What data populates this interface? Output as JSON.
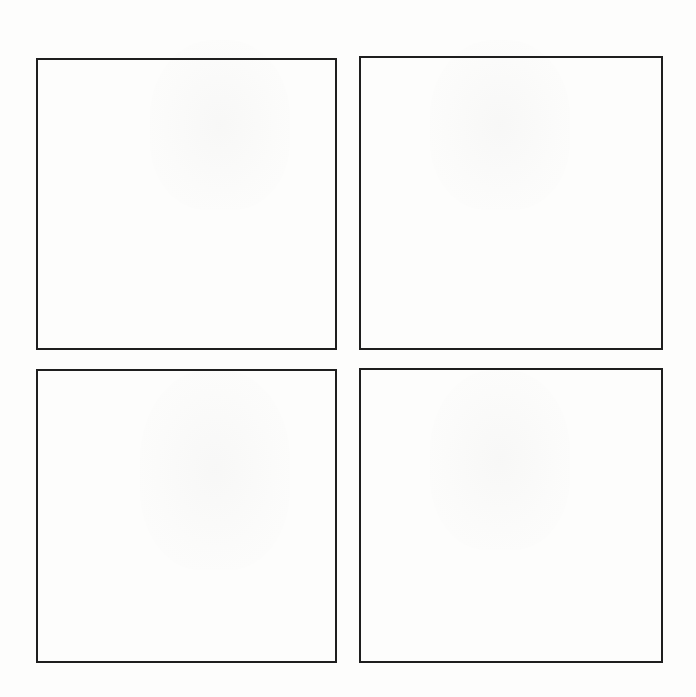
{
  "page": {
    "width": 696,
    "height": 697,
    "background": "#fdfdfc"
  },
  "panels": [
    {
      "id": "top-left",
      "row": 0,
      "col": 0,
      "x": 36,
      "y": 58,
      "w": 301,
      "h": 292,
      "content": ""
    },
    {
      "id": "top-right",
      "row": 0,
      "col": 1,
      "x": 359,
      "y": 56,
      "w": 304,
      "h": 294,
      "content": ""
    },
    {
      "id": "bottom-left",
      "row": 1,
      "col": 0,
      "x": 36,
      "y": 369,
      "w": 301,
      "h": 294,
      "content": ""
    },
    {
      "id": "bottom-right",
      "row": 1,
      "col": 1,
      "x": 359,
      "y": 368,
      "w": 304,
      "h": 295,
      "content": ""
    }
  ],
  "colors": {
    "border": "#1e1e1e",
    "background": "#fdfdfc"
  }
}
